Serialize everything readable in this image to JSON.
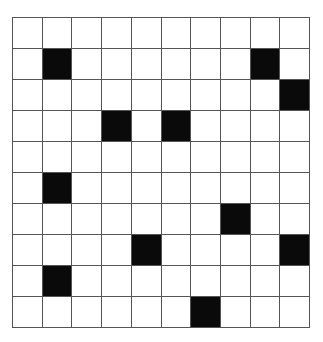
{
  "grid": {
    "rows": 10,
    "cols": 10,
    "fill_color": "#0a0a0a",
    "empty_color": "#ffffff",
    "line_color": "#555555",
    "filled_cells": [
      [
        1,
        1
      ],
      [
        1,
        8
      ],
      [
        2,
        9
      ],
      [
        3,
        3
      ],
      [
        3,
        5
      ],
      [
        5,
        1
      ],
      [
        6,
        7
      ],
      [
        7,
        4
      ],
      [
        7,
        9
      ],
      [
        8,
        1
      ],
      [
        9,
        6
      ]
    ]
  }
}
